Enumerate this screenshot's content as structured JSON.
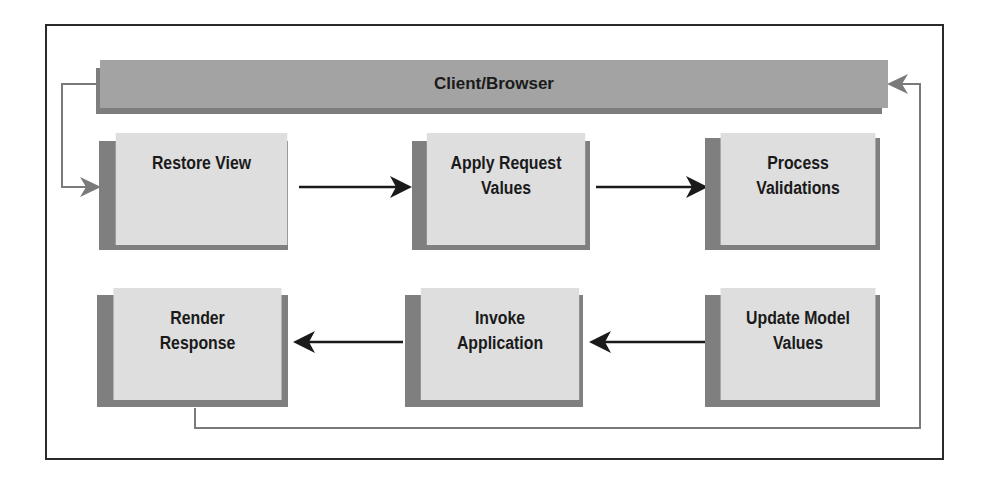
{
  "diagram": {
    "type": "flow",
    "title": "",
    "header": {
      "label": "Client/Browser",
      "color": "#a3a3a3"
    },
    "colors": {
      "box_fill": "#dedede",
      "box_shadow": "#7f7f7f",
      "arrow": "#1a1a1a",
      "return_line": "#7a7a7a",
      "frame": "#2a2a2a"
    },
    "nodes": [
      {
        "id": "restore_view",
        "line1": "Restore View",
        "line2": ""
      },
      {
        "id": "apply_request_values",
        "line1": "Apply Request",
        "line2": "Values"
      },
      {
        "id": "process_validations",
        "line1": "Process",
        "line2": "Validations"
      },
      {
        "id": "update_model_values",
        "line1": "Update Model",
        "line2": "Values"
      },
      {
        "id": "invoke_application",
        "line1": "Invoke",
        "line2": "Application"
      },
      {
        "id": "render_response",
        "line1": "Render",
        "line2": "Response"
      }
    ],
    "edges": [
      {
        "from": "client_browser",
        "to": "restore_view",
        "style": "gray"
      },
      {
        "from": "restore_view",
        "to": "apply_request_values",
        "style": "black"
      },
      {
        "from": "apply_request_values",
        "to": "process_validations",
        "style": "black"
      },
      {
        "from": "update_model_values",
        "to": "invoke_application",
        "style": "black"
      },
      {
        "from": "invoke_application",
        "to": "render_response",
        "style": "black"
      },
      {
        "from": "render_response",
        "to": "client_browser",
        "style": "gray"
      }
    ]
  }
}
